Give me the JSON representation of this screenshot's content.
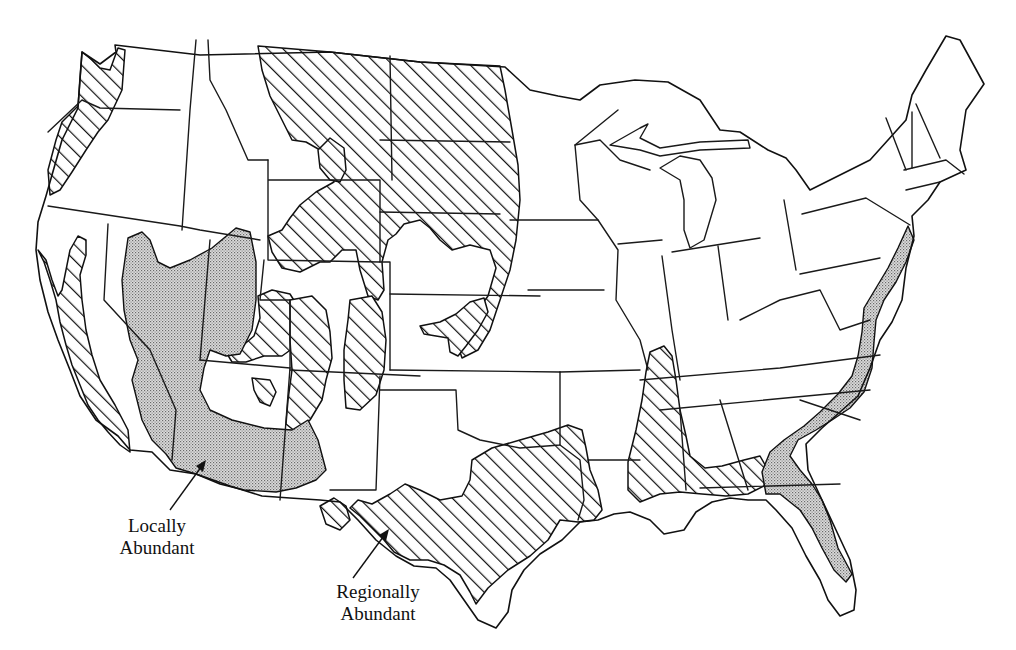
{
  "map": {
    "subject": "Contiguous United States",
    "style": "black-and-white line map with state boundaries",
    "background_color": "#ffffff",
    "line_color": "#111111"
  },
  "legend": {
    "locally_abundant": {
      "line1": "Locally",
      "line2": "Abundant",
      "pattern": "stipple",
      "fill_color": "#cfcfcf",
      "pointer_target": "Arizona / southwest desert region"
    },
    "regionally_abundant": {
      "line1": "Regionally",
      "line2": "Abundant",
      "pattern": "diagonal-hatch",
      "fill_color": "#111111",
      "pointer_target": "South Texas"
    }
  },
  "regions": {
    "regionally_abundant": [
      "Western Washington and Oregon coast",
      "California coast and Central Valley",
      "Northern Great Plains (Montana, North Dakota, South Dakota)",
      "Wyoming and Colorado front ranges",
      "Eastern Nebraska/Kansas band",
      "Texas and Oklahoma",
      "Lower Mississippi valley and Gulf coast",
      "New Mexico ranges"
    ],
    "locally_abundant": [
      "Great Basin (Nevada, Utah)",
      "Arizona and southern deserts",
      "Southeast New Mexico",
      "Atlantic coastal plain (New Jersey to Georgia)",
      "Florida peninsula"
    ]
  }
}
